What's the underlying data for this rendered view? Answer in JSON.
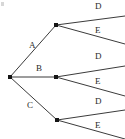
{
  "diagram": {
    "kind": "tree-diagram",
    "canvas": {
      "width": 125,
      "height": 139,
      "background": "#ffffff"
    },
    "style": {
      "line_color": "#3b3b3b",
      "node_color": "#151515",
      "label_color": "#2a2a2a",
      "line_width": 1,
      "node_size": 3
    },
    "root": {
      "label": "",
      "x": 10,
      "y": 77
    },
    "level1": [
      {
        "label": "A",
        "node_x": 56,
        "node_y": 25,
        "label_x": 29,
        "label_y": 41
      },
      {
        "label": "B",
        "node_x": 56,
        "node_y": 77,
        "label_x": 36,
        "label_y": 64
      },
      {
        "label": "C",
        "node_x": 57,
        "node_y": 120,
        "label_x": 27,
        "label_y": 101
      }
    ],
    "level2": [
      {
        "parent": "A",
        "label": "D",
        "end_x": 125,
        "end_y": 16,
        "label_x": 95,
        "label_y": 2
      },
      {
        "parent": "A",
        "label": "E",
        "end_x": 125,
        "end_y": 44,
        "label_x": 95,
        "label_y": 26
      },
      {
        "parent": "B",
        "label": "D",
        "end_x": 125,
        "end_y": 66,
        "label_x": 95,
        "label_y": 52
      },
      {
        "parent": "B",
        "label": "E",
        "end_x": 125,
        "end_y": 96,
        "label_x": 95,
        "label_y": 77
      },
      {
        "parent": "C",
        "label": "D",
        "end_x": 125,
        "end_y": 110,
        "label_x": 95,
        "label_y": 97
      },
      {
        "parent": "C",
        "label": "E",
        "end_x": 125,
        "end_y": 139,
        "label_x": 95,
        "label_y": 121
      }
    ],
    "labels": {
      "branch_a": "A",
      "branch_b": "B",
      "branch_c": "C",
      "a_d": "D",
      "a_e": "E",
      "b_d": "D",
      "b_e": "E",
      "c_d": "D",
      "c_e": "E"
    }
  }
}
